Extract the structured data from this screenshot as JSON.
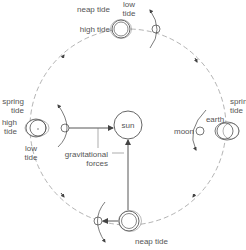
{
  "diagram": {
    "colors": {
      "line": "#555555",
      "orbit": "#9a9a9a",
      "background": "#ffffff"
    },
    "labels": {
      "sun": "sun",
      "earth": "earth",
      "moon": "moon",
      "gravitational": "gravitational",
      "forces": "forces",
      "top": {
        "neap_tide": "neap tide",
        "low": "low",
        "tide_low": "tide",
        "high_tide": "high tide"
      },
      "left": {
        "spring": "spring",
        "tide_spring": "tide",
        "high": "high",
        "tide_high": "tide",
        "low": "low",
        "tide_low": "tide"
      },
      "right": {
        "spring": "spring",
        "tide_spring": "tide"
      },
      "bottom": {
        "neap_tide": "neap tide"
      }
    }
  }
}
